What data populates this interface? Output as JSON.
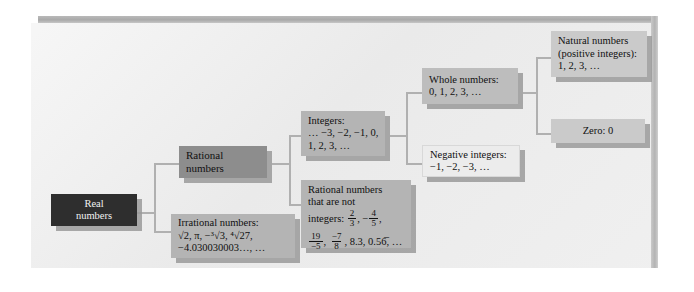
{
  "diagram": {
    "type": "tree",
    "colors": {
      "panel_background": "#ececec",
      "root_box": "#2e2e2e",
      "root_text": "#f2f2f2",
      "level2_box": "#8d8d8d",
      "level3_box": "#b4b4b4",
      "level4_box": "#bdbdbd",
      "level5_box": "#cacaca",
      "outline_box": "#ececec",
      "connector": "#b0b0b0",
      "shadow": "#9a9a9a",
      "frame_bar": "#b3b3b3"
    },
    "nodes": [
      {
        "id": "real-numbers",
        "label": "Real numbers",
        "lines": [
          "Real",
          "numbers"
        ],
        "style": "dark",
        "children": [
          "rational-numbers",
          "irrational-numbers"
        ]
      },
      {
        "id": "rational-numbers",
        "label": "Rational numbers",
        "lines": [
          "Rational",
          "numbers"
        ],
        "style": "mid",
        "children": [
          "integers",
          "rational-not-integers"
        ]
      },
      {
        "id": "irrational-numbers",
        "label": "Irrational numbers",
        "heading": "Irrational numbers:",
        "examples_line1": "√2, π, −³√3, ⁴√27,",
        "examples_line2": "−4.030030003…, …",
        "style": "lite",
        "children": []
      },
      {
        "id": "integers",
        "label": "Integers",
        "heading": "Integers:",
        "examples_line1": "… −3, −2, −1, 0,",
        "examples_line2": "1, 2, 3, …",
        "style": "lite",
        "children": [
          "whole-numbers",
          "negative-integers"
        ]
      },
      {
        "id": "rational-not-integers",
        "label": "Rational numbers that are not integers",
        "heading_line1": "Rational numbers",
        "heading_line2": "that are not",
        "heading_line3": "integers:",
        "fractions_row1": [
          "2/3",
          "−4/5"
        ],
        "fractions_row2": [
          "19/−5",
          "−7/8"
        ],
        "decimals": "8.3, 0.56̅, …",
        "style": "lite",
        "children": []
      },
      {
        "id": "whole-numbers",
        "label": "Whole numbers",
        "heading": "Whole numbers:",
        "examples": "0, 1, 2, 3, …",
        "style": "lite2",
        "children": [
          "natural-numbers",
          "zero"
        ]
      },
      {
        "id": "negative-integers",
        "label": "Negative integers",
        "heading": "Negative integers:",
        "examples": "−1, −2, −3, …",
        "style": "outline",
        "children": []
      },
      {
        "id": "natural-numbers",
        "label": "Natural numbers (positive integers)",
        "heading_line1": "Natural numbers",
        "heading_line2": "(positive integers):",
        "examples": "1, 2, 3, …",
        "style": "pale",
        "children": []
      },
      {
        "id": "zero",
        "label": "Zero",
        "heading": "Zero: 0",
        "style": "pale",
        "children": []
      }
    ],
    "fraction_values": {
      "f1": {
        "num": "2",
        "den": "3"
      },
      "f2": {
        "sign": "−",
        "num": "4",
        "den": "5"
      },
      "f3": {
        "num": "19",
        "den": "−5"
      },
      "f4": {
        "num": "−7",
        "den": "8"
      }
    }
  }
}
